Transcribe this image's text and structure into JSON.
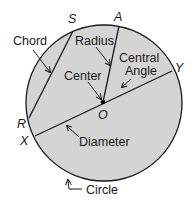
{
  "colors": {
    "fill": "#d4d4d4",
    "stroke": "#1a1a1a",
    "background": "#ffffff"
  },
  "points": {
    "S": "S",
    "A": "A",
    "Y": "Y",
    "R": "R",
    "X": "X",
    "O": "O"
  },
  "labels": {
    "chord": "Chord",
    "radius": "Radius",
    "central_angle_line1": "Central",
    "central_angle_line2": "Angle",
    "center": "Center",
    "diameter": "Diameter",
    "circle": "Circle"
  }
}
